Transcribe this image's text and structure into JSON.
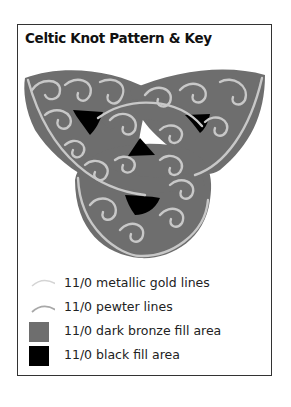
{
  "title": "Celtic Knot Pattern & Key",
  "colors": {
    "fill": "#6e6e6e",
    "line": "#c8c8c8",
    "black": "#000000",
    "border": "#333333"
  },
  "legend": [
    {
      "label": "11/0 metallic gold lines",
      "symbol": "arc-line",
      "color": "#d4d4d4"
    },
    {
      "label": "11/0 pewter lines",
      "symbol": "arc-line",
      "color": "#a8a8a8"
    },
    {
      "label": "11/0 dark bronze fill area",
      "symbol": "square",
      "color": "#6e6e6e"
    },
    {
      "label": "11/0 black fill area",
      "symbol": "square",
      "color": "#000000"
    }
  ]
}
